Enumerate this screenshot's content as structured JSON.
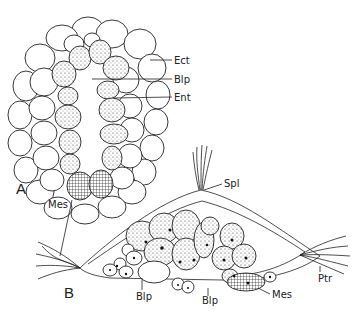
{
  "figure": {
    "panel_a": {
      "letter": "A",
      "labels": {
        "ect": "Ect",
        "blp": "Blp",
        "ent": "Ent",
        "mes": "Mes"
      }
    },
    "panel_b": {
      "letter": "B",
      "labels": {
        "spl": "Spl",
        "blp_left": "Blp",
        "blp_right": "Blp",
        "mes": "Mes",
        "ptr": "Ptr"
      }
    }
  }
}
